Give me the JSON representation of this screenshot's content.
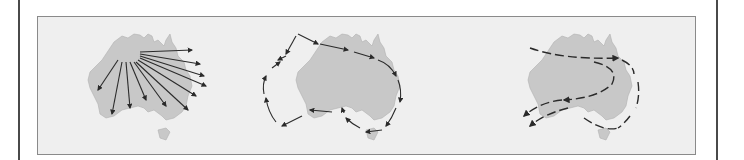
{
  "figure": {
    "panels": [
      {
        "id": "a",
        "description": "Radiating arrows from north-western origin across continent"
      },
      {
        "id": "b",
        "description": "Coastal arrows circling the continent"
      },
      {
        "id": "c",
        "description": "Dashed migration routes through interior and around coast"
      }
    ],
    "colors": {
      "land": "#c8c8c8",
      "panel_background": "#efefef",
      "arrow": "#2a2a2a",
      "frame": "#4a4a4a"
    }
  }
}
